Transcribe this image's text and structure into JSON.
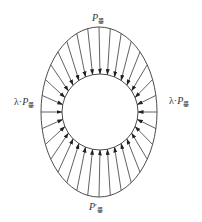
{
  "diagram": {
    "title": "",
    "colors": {
      "stroke": "#3a3a3a",
      "text": "#333333",
      "background": "#ffffff"
    },
    "outer_ellipse": {
      "cx": 99,
      "cy": 112,
      "rx": 58,
      "ry": 85
    },
    "inner_circle": {
      "cx": 100,
      "cy": 112,
      "r": 38
    },
    "arrow_count": 32,
    "labels": {
      "top": {
        "base": "P",
        "prime": "",
        "sub": "垂"
      },
      "bottom": {
        "base": "P",
        "prime": "′",
        "sub": "垂"
      },
      "left": {
        "coef": "λ·",
        "base": "P",
        "sub": "垂"
      },
      "right": {
        "coef": "λ·",
        "base": "P",
        "sub": "垂"
      }
    }
  }
}
